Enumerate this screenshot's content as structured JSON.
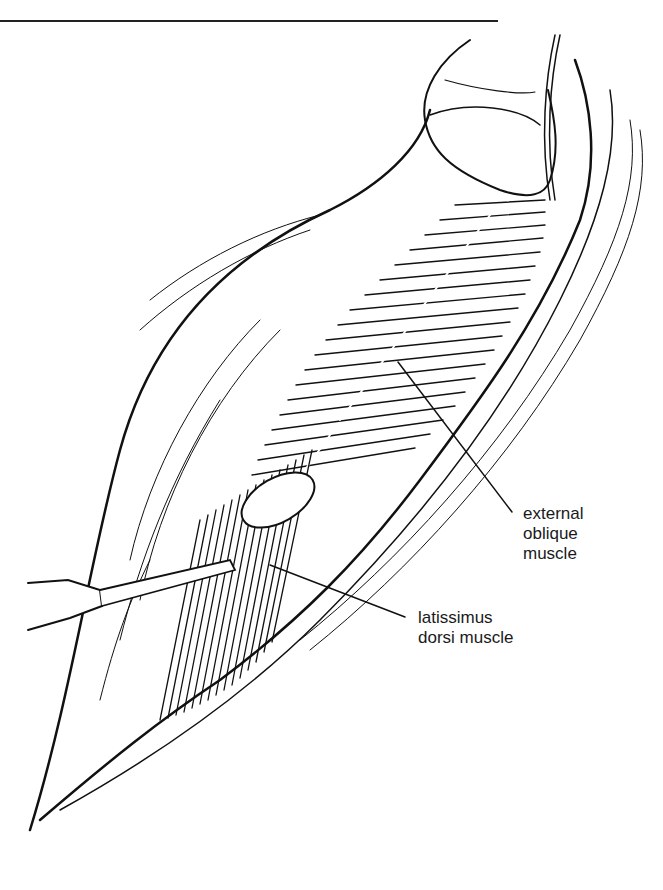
{
  "figure": {
    "type": "surgical-illustration",
    "labels": {
      "external_oblique": {
        "line1": "external",
        "line2": "oblique",
        "line3": "muscle"
      },
      "latissimus_dorsi": {
        "line1": "latissimus",
        "line2": "dorsi muscle"
      }
    }
  }
}
